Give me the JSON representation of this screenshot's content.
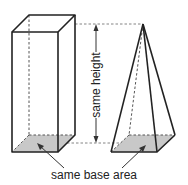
{
  "diagram": {
    "labels": {
      "height": "same height",
      "base": "same base area"
    },
    "shapes": [
      {
        "name": "rectangular prism",
        "position": "left"
      },
      {
        "name": "square pyramid",
        "position": "right"
      }
    ],
    "colors": {
      "edge": "#222222",
      "base_fill": "#c8c8c8",
      "background": "#ffffff"
    }
  }
}
